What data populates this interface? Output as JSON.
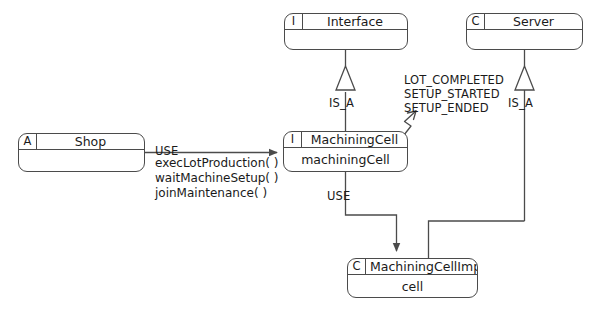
{
  "diagram": {
    "line_color": "#4b4b4b",
    "text_color": "#1a1a1a",
    "background": "#ffffff"
  },
  "boxes": {
    "interface": {
      "stereotype": "I",
      "name": "Interface",
      "attribute": ""
    },
    "server": {
      "stereotype": "C",
      "name": "Server",
      "attribute": ""
    },
    "shop": {
      "stereotype": "A",
      "name": "Shop",
      "attribute": ""
    },
    "machining_cell": {
      "stereotype": "I",
      "name": "MachiningCell",
      "attribute": "machiningCell"
    },
    "machining_cell_impl": {
      "stereotype": "C",
      "name": "MachiningCellImpl",
      "attribute": "cell"
    }
  },
  "relations": {
    "is_a_interface": "IS_A",
    "is_a_server": "IS_A",
    "use_shop_to_cell": "USE",
    "use_cell_to_impl": "USE"
  },
  "methods": {
    "items": [
      "execLotProduction( )",
      "waitMachineSetup( )",
      "joinMaintenance( )"
    ]
  },
  "events": {
    "items": [
      "LOT_COMPLETED",
      "SETUP_STARTED",
      "SETUP_ENDED"
    ]
  }
}
